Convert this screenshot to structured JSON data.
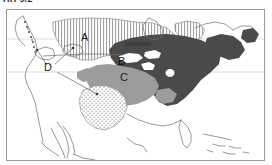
{
  "caption": {
    "text": "HH 9/2",
    "note": "cropped text at top edge of image"
  },
  "figure": {
    "name": "north-america-distribution-map",
    "frame_border_color": "#9a9a9a",
    "background_color": "#ffffff"
  },
  "labels": [
    {
      "id": "A",
      "text": "A",
      "x": 80,
      "y": 28,
      "region": "vertical-hatch-region",
      "on_dark": false
    },
    {
      "id": "B",
      "text": "B",
      "x": 117,
      "y": 52,
      "region": "dark-solid-region",
      "on_dark": true
    },
    {
      "id": "C",
      "text": "C",
      "x": 119,
      "y": 68,
      "region": "medium-gray-region",
      "on_dark": false
    },
    {
      "id": "D",
      "text": "D",
      "x": 43,
      "y": 64,
      "region": "leader-line-label",
      "on_dark": false
    }
  ],
  "legend_patterns": {
    "A_pattern": "vertical-line-hatch",
    "B_pattern": "solid-dark-gray",
    "C_pattern": "solid-medium-gray",
    "D_pattern": "stipple-dots"
  },
  "colors": {
    "coastline": "#6e6e6e",
    "graticule": "#bdbdbd",
    "dark_region": "#4a4a4a",
    "medium_region": "#9c9c9c",
    "hatch_line": "#8c8c8c",
    "stipple_dot": "#7a7a7a",
    "leader_line": "#666666",
    "label_text": "#1a1a1a"
  },
  "leader_lines": {
    "from_label_D": [
      {
        "to_x": 33,
        "to_y": 44,
        "target": "pacific-northwest-dot"
      },
      {
        "to_x": 64,
        "to_y": 42,
        "target": "great-basin-patch"
      },
      {
        "to_x": 96,
        "to_y": 92,
        "target": "stipple-region-texas"
      }
    ]
  }
}
